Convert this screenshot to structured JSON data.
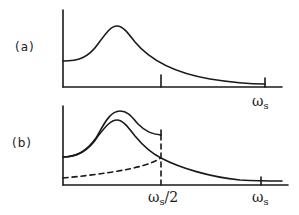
{
  "diagram": {
    "panels": [
      {
        "id": "a",
        "label": "(a)",
        "tick_labels": {
          "ws": "ω",
          "ws_sub": "s"
        }
      },
      {
        "id": "b",
        "label": "(b)",
        "tick_labels": {
          "ws_half": "ω",
          "ws_half_sub": "s",
          "ws_half_suffix": "/2",
          "ws": "ω",
          "ws_sub": "s"
        }
      }
    ],
    "colors": {
      "line": "#1a1a1a",
      "background": "#ffffff"
    }
  }
}
